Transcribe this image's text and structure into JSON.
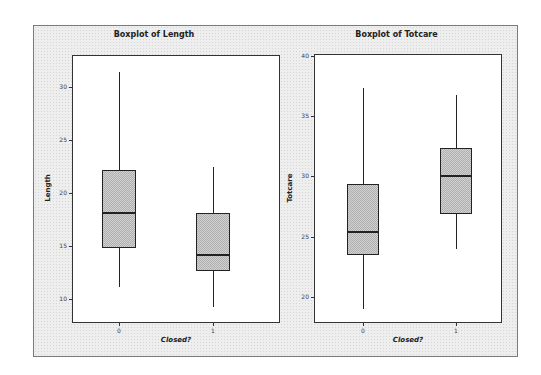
{
  "chart_data": [
    {
      "type": "box",
      "title": "Boxplot of Length",
      "xlabel": "Closed?",
      "ylabel": "Length",
      "categories": [
        "0",
        "1"
      ],
      "yticks": [
        10,
        15,
        20,
        25,
        30
      ],
      "ylim": [
        7.7,
        33.0
      ],
      "boxes": [
        {
          "category": "0",
          "min": 11.1,
          "q1": 14.8,
          "median": 18.1,
          "q3": 22.1,
          "max": 31.4
        },
        {
          "category": "1",
          "min": 9.2,
          "q1": 12.6,
          "median": 14.1,
          "q3": 18.1,
          "max": 22.4
        }
      ],
      "grid": false
    },
    {
      "type": "box",
      "title": "Boxplot of Totcare",
      "xlabel": "Closed?",
      "ylabel": "Totcare",
      "categories": [
        "0",
        "1"
      ],
      "yticks": [
        20,
        25,
        30,
        35,
        40
      ],
      "ylim": [
        17.8,
        40.2
      ],
      "boxes": [
        {
          "category": "0",
          "min": 19.0,
          "q1": 23.5,
          "median": 25.4,
          "q3": 29.4,
          "max": 37.4
        },
        {
          "category": "1",
          "min": 24.0,
          "q1": 26.9,
          "median": 30.0,
          "q3": 32.4,
          "max": 36.8
        }
      ],
      "grid": false
    }
  ],
  "colors": {
    "frame_bg": "#eeeeee",
    "plot_bg": "#ffffff",
    "box_fill": "#c8c8c8",
    "line": "#222222"
  }
}
